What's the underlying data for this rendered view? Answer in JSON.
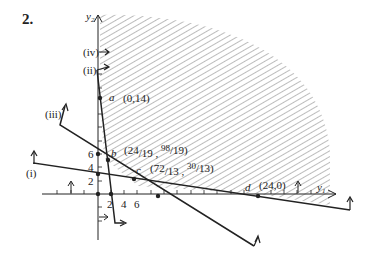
{
  "problem_number": "2.",
  "axes": {
    "x_label": "y",
    "x_sub": "1",
    "y_label": "y",
    "y_sub": "2",
    "x_ticks": [
      "2",
      "4",
      "6"
    ],
    "y_ticks": [
      "2",
      "4",
      "6"
    ]
  },
  "constraints": {
    "i": "(i)",
    "ii": "(ii)",
    "iii": "(iii)",
    "iv": "(iv)"
  },
  "points": {
    "a": {
      "name": "a",
      "coord": "(0,14)"
    },
    "b": {
      "name": "b",
      "coord_open": "(24",
      "coord_mid1": "/19 , ",
      "num2": "98",
      "coord_end": "/19)"
    },
    "c": {
      "name": "c",
      "coord_open": "(72",
      "coord_mid1": "/13 , ",
      "num2": "30",
      "coord_end": "/13)"
    },
    "d": {
      "name": "d",
      "coord": "(24,0)"
    }
  },
  "colors": {
    "ink": "#222222",
    "hatch": "#7a7a7a"
  }
}
